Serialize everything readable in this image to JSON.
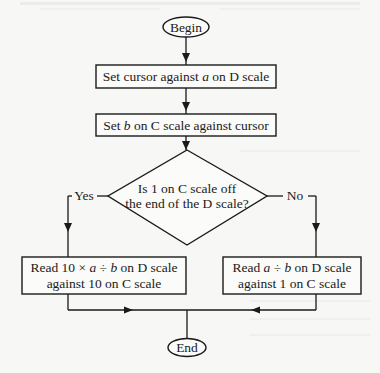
{
  "diagram": {
    "type": "flowchart",
    "nodes": {
      "begin": {
        "shape": "terminal",
        "label": "Begin"
      },
      "step1": {
        "shape": "process",
        "parts": [
          "Set cursor against ",
          "a",
          " on D scale"
        ]
      },
      "step2": {
        "shape": "process",
        "parts": [
          "Set ",
          "b",
          " on C scale against cursor"
        ]
      },
      "decision": {
        "shape": "decision",
        "line1": "Is 1 on C scale off",
        "line2": "the end of the D scale?"
      },
      "yes_box": {
        "shape": "process",
        "line1_parts": [
          "Read 10 × ",
          "a",
          " ÷ ",
          "b",
          " on D scale"
        ],
        "line2": "against 10 on C scale"
      },
      "no_box": {
        "shape": "process",
        "line1_parts": [
          "Read ",
          "a",
          " ÷ ",
          "b",
          " on D scale"
        ],
        "line2": "against 1 on C scale"
      },
      "end": {
        "shape": "terminal",
        "label": "End"
      }
    },
    "edges": {
      "yes_label": "Yes",
      "no_label": "No"
    },
    "colors": {
      "line": "#1a1a1a",
      "background": "#f7f7f5"
    }
  }
}
